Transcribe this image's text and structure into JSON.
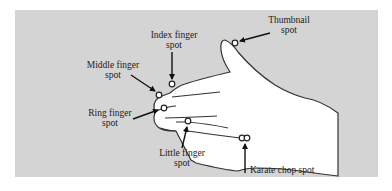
{
  "diagram": {
    "colors": {
      "panel_background": "#d4d4d4",
      "hand_fill": "#ffffff",
      "outline": "#333333"
    },
    "labels": {
      "index_finger": {
        "line1": "Index finger",
        "line2": "spot"
      },
      "thumbnail": {
        "line1": "Thumbnail",
        "line2": "spot"
      },
      "middle_finger": {
        "line1": "Middle finger",
        "line2": "spot"
      },
      "ring_finger": {
        "line1": "Ring finger",
        "line2": "spot"
      },
      "little_finger": {
        "line1": "Little finger",
        "line2": "spot"
      },
      "karate_chop": {
        "line1": "Karate chop spot"
      }
    }
  }
}
